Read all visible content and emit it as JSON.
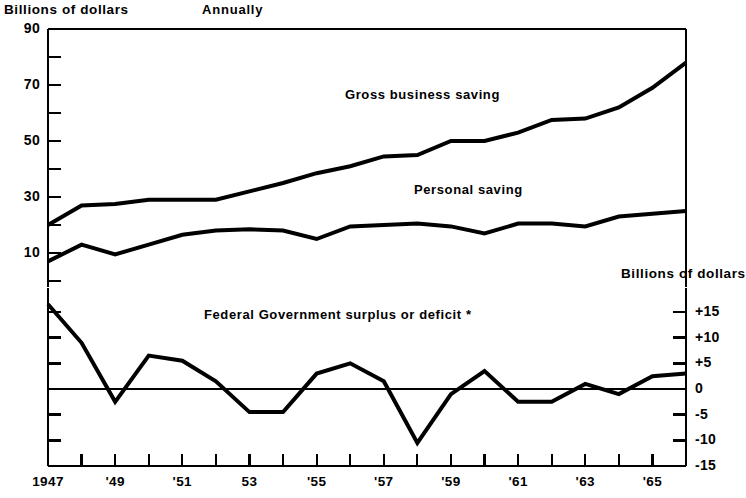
{
  "header": {
    "left_axis_title": "Billions of dollars",
    "top_note": "Annually",
    "right_axis_title": "Billions of dollars"
  },
  "labels": {
    "gross_business_saving": "Gross business saving",
    "personal_saving": "Personal saving",
    "federal_government": "Federal Government surplus or deficit *"
  },
  "chart_data": {
    "type": "line",
    "title": "",
    "subtitle": "Annually",
    "xlabel": "",
    "ylabel": "Billions of dollars",
    "y2label": "Billions of dollars",
    "grid": false,
    "legend": "inline-annotation",
    "x": [
      1947,
      1948,
      1949,
      1950,
      1951,
      1952,
      1953,
      1954,
      1955,
      1956,
      1957,
      1958,
      1959,
      1960,
      1961,
      1962,
      1963,
      1964,
      1965,
      1966
    ],
    "upper_panel": {
      "ylim": [
        0,
        90
      ],
      "major_ticks": [
        10,
        30,
        50,
        70,
        90
      ],
      "minor_ticks": [
        20,
        40,
        60,
        80
      ],
      "tick_labels": [
        "10",
        "30",
        "50",
        "70",
        "90"
      ],
      "series": [
        {
          "name": "Gross business saving",
          "values": [
            20,
            27,
            27.5,
            29,
            29,
            29,
            32,
            35,
            38.5,
            41,
            44.5,
            45,
            50,
            50,
            53,
            57.5,
            58,
            62,
            69,
            78
          ]
        },
        {
          "name": "Personal saving",
          "values": [
            7,
            13,
            9.5,
            13,
            16.5,
            18,
            18.5,
            18,
            15,
            19.5,
            20,
            20.5,
            19.5,
            17,
            20.5,
            20.5,
            19.5,
            23,
            24,
            25
          ]
        }
      ]
    },
    "lower_panel": {
      "ylim": [
        -15,
        15
      ],
      "major_ticks": [
        -15,
        -10,
        -5,
        0,
        5,
        10,
        15
      ],
      "tick_labels": [
        "+15",
        "+10",
        "+5",
        "0",
        "-5",
        "-10",
        "-15"
      ],
      "zero_line": 0,
      "series": [
        {
          "name": "Federal Government surplus or deficit *",
          "values": [
            16.5,
            9,
            -2.5,
            6.5,
            5.5,
            1.5,
            -4.5,
            -4.5,
            3,
            5,
            1.5,
            -10.5,
            -1,
            3.5,
            -2.5,
            -2.5,
            1,
            -1,
            2.5,
            3
          ]
        }
      ]
    },
    "x_tick_labels": [
      {
        "year": 1947,
        "label": "1947"
      },
      {
        "year": 1949,
        "label": "'49"
      },
      {
        "year": 1951,
        "label": "'51"
      },
      {
        "year": 1953,
        "label": "53"
      },
      {
        "year": 1955,
        "label": "'55"
      },
      {
        "year": 1957,
        "label": "'57"
      },
      {
        "year": 1959,
        "label": "'59"
      },
      {
        "year": 1961,
        "label": "'61"
      },
      {
        "year": 1963,
        "label": "'63"
      },
      {
        "year": 1965,
        "label": "'65"
      }
    ],
    "colors": {
      "line": "#000000",
      "axis": "#000000",
      "background": "#ffffff"
    }
  }
}
